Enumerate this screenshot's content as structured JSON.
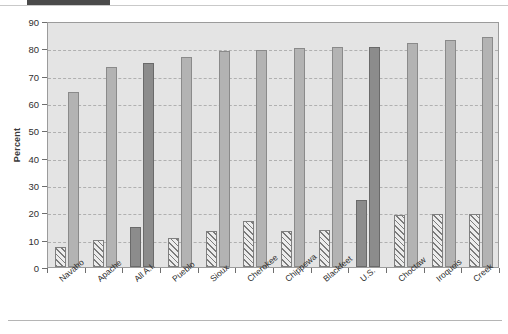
{
  "figure": {
    "ylabel": "Percent"
  },
  "chart_data": {
    "type": "bar",
    "title": "",
    "xlabel": "",
    "ylabel": "Percent",
    "ylim": [
      0,
      90
    ],
    "ytick_step": 10,
    "ytick_labels": [
      "90",
      "80",
      "70",
      "60",
      "50",
      "40",
      "30",
      "20",
      "10",
      "0"
    ],
    "grid": true,
    "legend": "none",
    "categories": [
      "Navaho",
      "Apache",
      "All A.I.",
      "Pueblo",
      "Sioux",
      "Cherokee",
      "Chippewa",
      "Blackfeet",
      "U.S.",
      "Choctaw",
      "Iroquois",
      "Creek"
    ],
    "series": [
      {
        "name": "series-1",
        "values": [
          7.5,
          10,
          14.5,
          10.5,
          13,
          17,
          13,
          13.5,
          24.5,
          19,
          19.5,
          19.5
        ]
      },
      {
        "name": "series-2",
        "values": [
          64,
          73,
          74.5,
          77,
          79,
          79.5,
          80,
          80.5,
          80.5,
          82,
          83,
          84
        ]
      }
    ],
    "highlight_categories": [
      "All A.I.",
      "U.S."
    ],
    "colors": {
      "bar_light": "#b3b3b3",
      "bar_dark": "#8c8c8c",
      "hatch_fill": "#ececec",
      "hatch_line": "#7b7b7b",
      "plot_background": "#e4e4e4",
      "gridline": "#b0b0b0",
      "axis": "#6e6e6e"
    }
  }
}
